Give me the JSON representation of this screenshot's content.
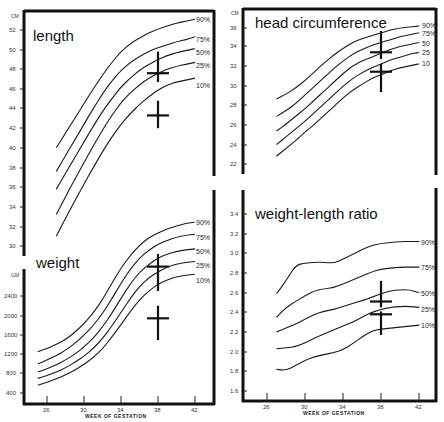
{
  "chart_data": [
    {
      "type": "line",
      "title": "length",
      "ylabel": "CM",
      "xlabel": "WEEK OF GESTATION",
      "ylim": [
        29,
        53
      ],
      "yticks": [
        30,
        32,
        34,
        36,
        38,
        40,
        42,
        44,
        46,
        48,
        50,
        52
      ],
      "x": [
        27,
        28,
        29,
        30,
        31,
        32,
        33,
        34,
        35,
        36,
        37,
        38,
        39,
        40,
        41,
        42
      ],
      "series": [
        {
          "name": "90%",
          "values": [
            40.0,
            41.5,
            43.0,
            44.5,
            46.0,
            47.4,
            48.7,
            49.8,
            50.6,
            51.2,
            51.7,
            52.1,
            52.4,
            52.7,
            52.9,
            53.1
          ]
        },
        {
          "name": "75%",
          "values": [
            37.6,
            39.2,
            40.8,
            42.4,
            44.0,
            45.5,
            46.8,
            47.9,
            48.7,
            49.3,
            49.8,
            50.2,
            50.5,
            50.8,
            51.0,
            51.3
          ]
        },
        {
          "name": "50%",
          "values": [
            35.8,
            37.4,
            39.0,
            40.6,
            42.2,
            43.7,
            45.0,
            46.2,
            47.1,
            47.9,
            48.5,
            49.0,
            49.4,
            49.7,
            49.9,
            50.1
          ]
        },
        {
          "name": "25%",
          "values": [
            33.2,
            35.0,
            36.8,
            38.5,
            40.2,
            41.8,
            43.3,
            44.6,
            45.6,
            46.4,
            47.1,
            47.6,
            48.0,
            48.3,
            48.5,
            48.7
          ]
        },
        {
          "name": "10%",
          "values": [
            31.0,
            32.8,
            34.6,
            36.3,
            38.0,
            39.6,
            41.1,
            42.4,
            43.5,
            44.4,
            45.2,
            45.9,
            46.4,
            46.7,
            46.9,
            47.1
          ]
        }
      ],
      "markers": [
        {
          "x": 38,
          "y": 47.6,
          "y_range": [
            46.7,
            49.8
          ]
        },
        {
          "x": 38,
          "y": 43.3,
          "y_range": [
            42.0,
            44.8
          ]
        }
      ]
    },
    {
      "type": "line",
      "title": "weight",
      "ylabel": "GM",
      "xlabel": "WEEK OF GESTATION",
      "xticks": [
        26,
        30,
        34,
        38,
        42
      ],
      "ylim": [
        300,
        3300
      ],
      "yticks": [
        400,
        800,
        1200,
        1600,
        2000,
        2400
      ],
      "x": [
        25,
        26,
        27,
        28,
        29,
        30,
        31,
        32,
        33,
        34,
        35,
        36,
        37,
        38,
        39,
        40,
        41,
        42
      ],
      "series": [
        {
          "name": "90%",
          "values": [
            1250,
            1320,
            1400,
            1500,
            1650,
            1830,
            2050,
            2320,
            2650,
            2950,
            3200,
            3400,
            3550,
            3650,
            3720,
            3780,
            3830,
            3860
          ]
        },
        {
          "name": "75%",
          "values": [
            1000,
            1080,
            1170,
            1280,
            1420,
            1590,
            1790,
            2040,
            2340,
            2650,
            2930,
            3150,
            3300,
            3420,
            3500,
            3560,
            3600,
            3620
          ]
        },
        {
          "name": "50%",
          "values": [
            830,
            900,
            980,
            1080,
            1200,
            1350,
            1530,
            1760,
            2040,
            2350,
            2640,
            2870,
            3020,
            3150,
            3230,
            3280,
            3310,
            3330
          ]
        },
        {
          "name": "25%",
          "values": [
            700,
            760,
            830,
            920,
            1030,
            1160,
            1320,
            1520,
            1780,
            2060,
            2350,
            2590,
            2760,
            2880,
            2970,
            3030,
            3060,
            3080
          ]
        },
        {
          "name": "10%",
          "values": [
            560,
            620,
            690,
            770,
            870,
            990,
            1130,
            1310,
            1550,
            1810,
            2080,
            2320,
            2500,
            2630,
            2720,
            2780,
            2810,
            2830
          ]
        }
      ],
      "markers": [
        {
          "x": 38,
          "y": 2980,
          "y_range": [
            2500,
            3230
          ]
        },
        {
          "x": 38,
          "y": 1940,
          "y_range": [
            1490,
            2200
          ]
        }
      ]
    },
    {
      "type": "line",
      "title": "head circumference",
      "ylabel": "CM",
      "xlabel": "",
      "ylim": [
        21,
        37
      ],
      "yticks": [
        22,
        24,
        26,
        28,
        30,
        32,
        34,
        36
      ],
      "x": [
        27,
        28,
        29,
        30,
        31,
        32,
        33,
        34,
        35,
        36,
        37,
        38,
        39,
        40,
        41,
        42
      ],
      "series": [
        {
          "name": "90%",
          "values": [
            28.7,
            29.2,
            29.8,
            30.6,
            31.5,
            32.4,
            33.2,
            33.9,
            34.5,
            34.9,
            35.2,
            35.5,
            35.8,
            36.0,
            36.1,
            36.2
          ]
        },
        {
          "name": "75%",
          "values": [
            26.9,
            27.5,
            28.2,
            29.1,
            30.0,
            30.9,
            31.8,
            32.6,
            33.3,
            33.8,
            34.2,
            34.5,
            34.8,
            35.1,
            35.3,
            35.5
          ]
        },
        {
          "name": "50%",
          "values": [
            25.4,
            26.1,
            26.9,
            27.7,
            28.6,
            29.5,
            30.4,
            31.3,
            32.1,
            32.6,
            33.0,
            33.4,
            33.8,
            34.1,
            34.3,
            34.5
          ]
        },
        {
          "name": "25%",
          "values": [
            24.0,
            24.8,
            25.6,
            26.4,
            27.3,
            28.2,
            29.1,
            30.0,
            30.8,
            31.4,
            31.9,
            32.3,
            32.7,
            33.0,
            33.3,
            33.5
          ]
        },
        {
          "name": "10%",
          "values": [
            22.8,
            23.6,
            24.4,
            25.3,
            26.1,
            27.0,
            27.9,
            28.8,
            29.6,
            30.2,
            30.8,
            31.2,
            31.6,
            31.9,
            32.1,
            32.3
          ]
        }
      ],
      "markers": [
        {
          "x": 38,
          "y": 33.5,
          "y_range": [
            32.8,
            35.7
          ]
        },
        {
          "x": 38,
          "y": 31.5,
          "y_range": [
            29.4,
            32.3
          ]
        }
      ]
    },
    {
      "type": "line",
      "title": "weight-length ratio",
      "ylabel": "",
      "xlabel": "WEEK OF GESTATION",
      "xticks": [
        26,
        30,
        34,
        38,
        42
      ],
      "ylim": [
        1.55,
        3.45
      ],
      "yticks": [
        1.6,
        1.8,
        2.0,
        2.2,
        2.4,
        2.6,
        2.8,
        3.0,
        3.2,
        3.4
      ],
      "x": [
        27,
        28,
        29,
        30,
        31,
        32,
        33,
        34,
        35,
        36,
        37,
        38,
        39,
        40,
        41,
        42
      ],
      "series": [
        {
          "name": "90%",
          "values": [
            2.59,
            2.72,
            2.88,
            2.9,
            2.91,
            2.91,
            2.9,
            2.94,
            2.99,
            3.04,
            3.08,
            3.1,
            3.11,
            3.12,
            3.12,
            3.12
          ]
        },
        {
          "name": "75%",
          "values": [
            2.35,
            2.45,
            2.51,
            2.57,
            2.62,
            2.64,
            2.65,
            2.69,
            2.73,
            2.77,
            2.81,
            2.84,
            2.85,
            2.86,
            2.86,
            2.86
          ]
        },
        {
          "name": "50%",
          "values": [
            2.2,
            2.24,
            2.28,
            2.33,
            2.38,
            2.41,
            2.43,
            2.46,
            2.49,
            2.52,
            2.55,
            2.59,
            2.62,
            2.63,
            2.63,
            2.6
          ]
        },
        {
          "name": "25%",
          "values": [
            2.03,
            2.04,
            2.05,
            2.09,
            2.14,
            2.18,
            2.22,
            2.26,
            2.3,
            2.35,
            2.4,
            2.43,
            2.45,
            2.46,
            2.46,
            2.45
          ]
        },
        {
          "name": "10%",
          "values": [
            1.82,
            1.81,
            1.86,
            1.91,
            1.95,
            1.97,
            1.99,
            2.02,
            2.08,
            2.15,
            2.21,
            2.23,
            2.24,
            2.25,
            2.26,
            2.27
          ]
        }
      ],
      "markers": [
        {
          "x": 38,
          "y": 2.51,
          "y_range": [
            2.45,
            2.72
          ]
        },
        {
          "x": 38,
          "y": 2.38,
          "y_range": [
            2.17,
            2.41
          ]
        }
      ]
    }
  ],
  "panels": {
    "length": {
      "title": "length",
      "unit": "CM"
    },
    "weight": {
      "title": "weight",
      "unit": "GM"
    },
    "head": {
      "title": "head circumference",
      "unit": "CM"
    },
    "wlr": {
      "title": "weight-length ratio"
    }
  },
  "x_axis": {
    "label": "WEEK OF GESTATION",
    "ticks": [
      "26",
      "30",
      "34",
      "38",
      "42"
    ]
  },
  "percentile_labels": {
    "left": [
      "90%",
      "75%",
      "50%",
      "25%",
      "10%"
    ],
    "head": [
      "90%",
      "75%",
      "50",
      "25",
      "10"
    ],
    "wlr": [
      "90%",
      "75%",
      "50%",
      "25%",
      "10%"
    ]
  },
  "y_ticks": {
    "length": [
      "52",
      "50",
      "48",
      "46",
      "44",
      "42",
      "40",
      "38",
      "36",
      "34",
      "32",
      "30"
    ],
    "weight": [
      "2400",
      "2000",
      "1600",
      "1200",
      "800",
      "400"
    ],
    "head": [
      "36",
      "34",
      "32",
      "30",
      "28",
      "26",
      "24",
      "22"
    ],
    "wlr": [
      "3.4",
      "3.2",
      "3.0",
      "2.8",
      "2.6",
      "2.4",
      "2.2",
      "2.0",
      "1.8",
      "1.6"
    ]
  }
}
